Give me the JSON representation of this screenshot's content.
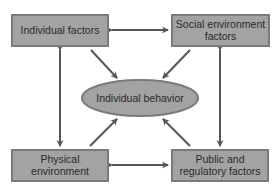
{
  "diagram": {
    "title": "",
    "colors": {
      "box_fill": "#a3a3a3",
      "box_stroke": "#7a7a7a",
      "arrow": "#555555",
      "text": "#2a2a2a",
      "background": "#ffffff"
    },
    "nodes": {
      "individual_factors": {
        "lines": [
          "Individual factors"
        ]
      },
      "social_environment": {
        "lines": [
          "Social environment",
          "factors"
        ]
      },
      "individual_behavior": {
        "lines": [
          "Individual behavior"
        ]
      },
      "physical_environment": {
        "lines": [
          "Physical",
          "environment"
        ]
      },
      "public_regulatory": {
        "lines": [
          "Public and",
          "regulatory factors"
        ]
      }
    },
    "edges": [
      {
        "from": "individual_factors",
        "to": "social_environment",
        "direction": "both"
      },
      {
        "from": "physical_environment",
        "to": "public_regulatory",
        "direction": "both"
      },
      {
        "from": "individual_factors",
        "to": "physical_environment",
        "direction": "both"
      },
      {
        "from": "social_environment",
        "to": "public_regulatory",
        "direction": "both"
      },
      {
        "from": "individual_factors",
        "to": "individual_behavior",
        "direction": "forward"
      },
      {
        "from": "social_environment",
        "to": "individual_behavior",
        "direction": "forward"
      },
      {
        "from": "physical_environment",
        "to": "individual_behavior",
        "direction": "forward"
      },
      {
        "from": "public_regulatory",
        "to": "individual_behavior",
        "direction": "forward"
      }
    ]
  }
}
